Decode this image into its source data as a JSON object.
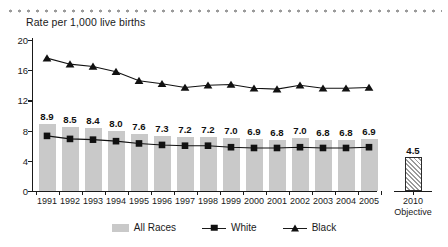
{
  "chart_data": {
    "type": "bar",
    "title": "Rate per 1,000 live births",
    "xlabel": "",
    "ylabel": "",
    "ylim": [
      0,
      20
    ],
    "yticks": [
      0,
      4,
      8,
      12,
      16,
      20
    ],
    "grid": false,
    "legend_position": "bottom",
    "categories": [
      "1991",
      "1992",
      "1993",
      "1994",
      "1995",
      "1996",
      "1997",
      "1998",
      "1999",
      "2000",
      "2001",
      "2002",
      "2003",
      "2004",
      "2005"
    ],
    "objective": {
      "label_year": "2010",
      "label_sub": "Objective",
      "value": 4.5,
      "value_label": "4.5"
    },
    "series": [
      {
        "name": "All Races",
        "type": "bar",
        "values": [
          8.9,
          8.5,
          8.4,
          8.0,
          7.6,
          7.3,
          7.2,
          7.2,
          7.0,
          6.9,
          6.8,
          7.0,
          6.8,
          6.8,
          6.9
        ],
        "value_labels": [
          "8.9",
          "8.5",
          "8.4",
          "8.0",
          "7.6",
          "7.3",
          "7.2",
          "7.2",
          "7.0",
          "6.9",
          "6.8",
          "7.0",
          "6.8",
          "6.8",
          "6.9"
        ],
        "color": "#c9c9c9"
      },
      {
        "name": "White",
        "type": "line",
        "marker": "square",
        "values": [
          7.3,
          6.9,
          6.8,
          6.6,
          6.3,
          6.1,
          6.0,
          6.0,
          5.8,
          5.7,
          5.7,
          5.8,
          5.7,
          5.7,
          5.8
        ],
        "color": "#111111"
      },
      {
        "name": "Black",
        "type": "line",
        "marker": "triangle",
        "values": [
          17.6,
          16.8,
          16.5,
          15.8,
          14.6,
          14.2,
          13.7,
          14.0,
          14.1,
          13.6,
          13.5,
          14.0,
          13.6,
          13.6,
          13.7
        ],
        "color": "#111111"
      }
    ]
  },
  "legend": {
    "items": [
      {
        "label": "All Races",
        "marker": "bar-swatch"
      },
      {
        "label": "White",
        "marker": "square-marker"
      },
      {
        "label": "Black",
        "marker": "triangle-marker"
      }
    ]
  }
}
